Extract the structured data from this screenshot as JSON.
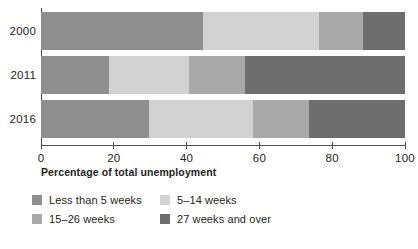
{
  "chart_data": {
    "type": "bar",
    "orientation": "horizontal",
    "stacked": true,
    "stacked_mode": "percent",
    "title": "",
    "xlabel": "Percentage of total unemployment",
    "ylabel": "",
    "xlim": [
      0,
      100
    ],
    "xticks": [
      0,
      20,
      40,
      60,
      80,
      100
    ],
    "xtick_labels": [
      "0",
      "20",
      "40",
      "60",
      "80",
      "100"
    ],
    "grid": false,
    "legend_position": "bottom-left",
    "categories": [
      "2000",
      "2011",
      "2016"
    ],
    "series": [
      {
        "name": "Less than 5 weeks",
        "color": "#8f8f8f",
        "values": [
          44.6,
          18.8,
          29.8
        ]
      },
      {
        "name": "5–14 weeks",
        "color": "#d2d2d2",
        "values": [
          31.9,
          21.8,
          28.5
        ]
      },
      {
        "name": "15–26 weeks",
        "color": "#a9a9a9",
        "values": [
          11.9,
          15.5,
          15.4
        ]
      },
      {
        "name": "27 weeks and over",
        "color": "#6e6e6e",
        "values": [
          11.6,
          43.9,
          26.3
        ]
      }
    ]
  },
  "axis": {
    "x_title": "Percentage of total unemployment",
    "tick_labels": [
      "0",
      "20",
      "40",
      "60",
      "80",
      "100"
    ],
    "year_labels": [
      "2000",
      "2011",
      "2016"
    ]
  },
  "legend": {
    "items": [
      {
        "label": "Less than 5 weeks",
        "color": "#8f8f8f"
      },
      {
        "label": "5–14 weeks",
        "color": "#d2d2d2"
      },
      {
        "label": "15–26 weeks",
        "color": "#a9a9a9"
      },
      {
        "label": "27 weeks and over",
        "color": "#6e6e6e"
      }
    ]
  }
}
